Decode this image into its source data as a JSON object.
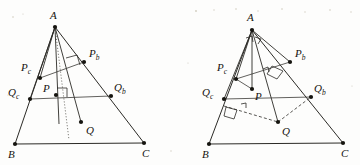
{
  "figure": {
    "ink_color": "#2b2a26",
    "background_color": "#fdfdfc",
    "panel_count": 2
  },
  "panels": [
    {
      "id": "left",
      "name": "left-diagram",
      "labels": {
        "apex": "A",
        "apex_sub": "",
        "bottom_left": "B",
        "bottom_right": "C",
        "pb": "P",
        "pb_sub": "b",
        "pc": "P",
        "pc_sub": "c",
        "qb": "Q",
        "qb_sub": "b",
        "qc": "Q",
        "qc_sub": "c",
        "p": "P",
        "q": "Q"
      },
      "points": {
        "A": [
          55,
          27
        ],
        "B": [
          15,
          144
        ],
        "C": [
          144,
          143
        ],
        "Pb": [
          84,
          62
        ],
        "Pc": [
          40,
          78
        ],
        "Qb": [
          111,
          96
        ],
        "Qc": [
          30,
          99
        ],
        "P": [
          56,
          95
        ],
        "Q": [
          81,
          122
        ]
      },
      "features": {
        "dotted_cevian": true,
        "dashed_connectors": false,
        "right_angle_marks": 2,
        "apex_angle_marks": 0
      }
    },
    {
      "id": "right",
      "name": "right-diagram",
      "labels": {
        "apex": "A",
        "bottom_left": "B",
        "bottom_right": "C",
        "pb": "P",
        "pb_sub": "b",
        "pc": "P",
        "pc_sub": "c",
        "qb": "Q",
        "qb_sub": "b",
        "qc": "Q",
        "qc_sub": "c",
        "p": "P",
        "q": "Q"
      },
      "points": {
        "A": [
          252,
          30
        ],
        "B": [
          209,
          144
        ],
        "C": [
          343,
          143
        ],
        "Pb": [
          290,
          62
        ],
        "Pc": [
          236,
          79
        ],
        "Qb": [
          311,
          97
        ],
        "Qc": [
          224,
          99
        ],
        "P": [
          252,
          89
        ],
        "Q": [
          278,
          122
        ]
      },
      "features": {
        "dotted_cevian": false,
        "dashed_connectors": true,
        "right_angle_marks": 3,
        "apex_angle_marks": 2
      }
    }
  ]
}
